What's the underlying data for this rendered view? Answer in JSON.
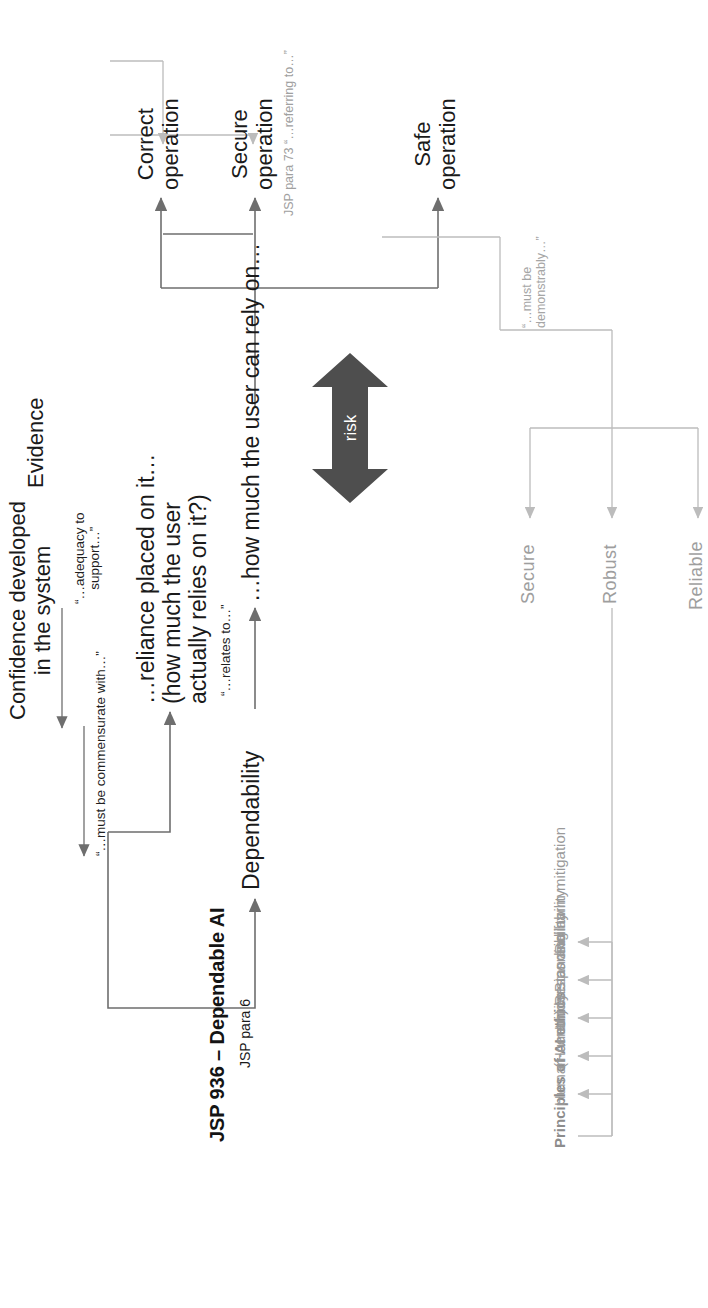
{
  "diagram": {
    "title": "JSP 936 – Dependable AI",
    "subtitle": "JSP para 6",
    "risk_label": "risk",
    "nodes": {
      "dependability": "Dependability",
      "reliance": "…reliance placed on it…\n(how much the user\nactually relies on it?)",
      "rely_on": "…how much the user can rely on…",
      "confidence": "Confidence developed\nin the system",
      "evidence": "Evidence",
      "safe_operation": "Safe\noperation",
      "secure_operation": "Secure\noperation",
      "correct_operation": "Correct\noperation"
    },
    "edge_labels": {
      "relates_to": "“…relates to…”",
      "commensurate": "“…must be commensurate with…”",
      "adequacy": "“…adequacy to\nsupport…”",
      "demonstrably": "“…must be\ndemonstrably…”",
      "jsp_para_73": "JSP para 73 “…referring to…”"
    },
    "ethics": {
      "heading": "Principles of AI ethics",
      "items": [
        "Human-centricity",
        "(Human) Responsibility",
        "Understanding",
        "Bias and harm mitigation",
        "Reliability"
      ]
    },
    "attributes": [
      "Reliable",
      "Robust",
      "Secure"
    ],
    "colors": {
      "text_dark": "#1a1a1a",
      "text_grey": "#9e9e9e",
      "line_dark": "#6e6e6e",
      "line_grey": "#bcbcbc",
      "risk_arrow": "#4e4e4e",
      "background": "#ffffff"
    }
  }
}
